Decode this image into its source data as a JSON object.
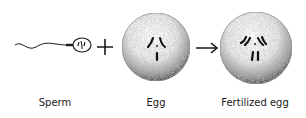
{
  "diagram": {
    "items": [
      {
        "id": "sperm",
        "label": "Sperm"
      },
      {
        "id": "egg",
        "label": "Egg"
      },
      {
        "id": "fertilized",
        "label": "Fertilized egg"
      }
    ],
    "operators": {
      "plus": "+",
      "arrow": "→"
    },
    "colors": {
      "ink": "#1a1a1a",
      "stipple": "#555555",
      "background": "#ffffff"
    }
  }
}
